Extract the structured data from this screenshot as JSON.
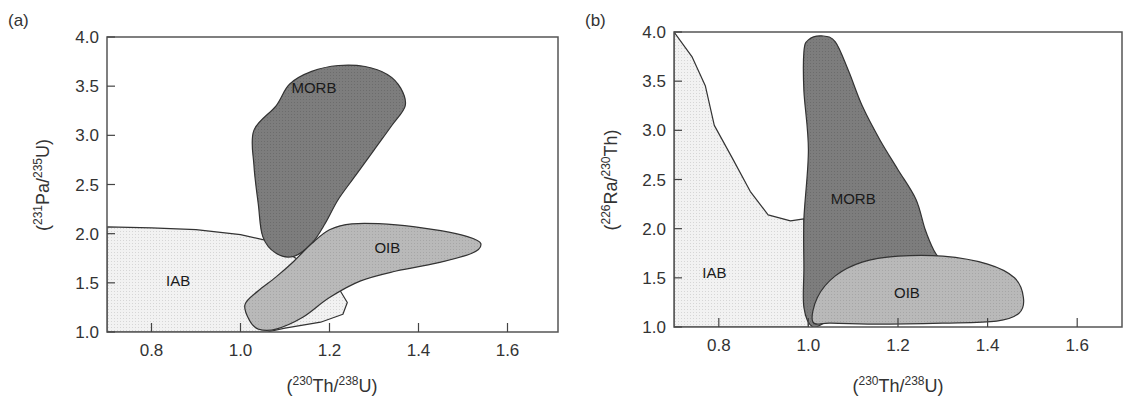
{
  "figure": {
    "panels": [
      {
        "id": "a",
        "label": "(a)",
        "xlabel": {
          "open": "(",
          "sup1": "230",
          "mid": "Th/",
          "sup2": "238",
          "close": "U)"
        },
        "ylabel": {
          "open": "(",
          "sup1": "231",
          "mid": "Pa/",
          "sup2": "235",
          "close": "U)"
        }
      },
      {
        "id": "b",
        "label": "(b)",
        "xlabel": {
          "open": "(",
          "sup1": "230",
          "mid": "Th/",
          "sup2": "238",
          "close": "U)"
        },
        "ylabel": {
          "open": "(",
          "sup1": "226",
          "mid": "Ra/",
          "sup2": "230",
          "close": "Th)"
        }
      }
    ]
  },
  "chart_data": [
    {
      "type": "area",
      "panel": "(a)",
      "title": "",
      "xlabel": "(230Th/238U)",
      "ylabel": "(231Pa/235U)",
      "xlim": [
        0.7,
        1.7
      ],
      "ylim": [
        1.0,
        4.0
      ],
      "xticks": [
        0.8,
        1.0,
        1.2,
        1.4,
        1.6
      ],
      "xtick_labels": [
        "0.8",
        "1.0",
        "1.2",
        "1.4",
        "1.6"
      ],
      "yticks": [
        1.0,
        1.5,
        2.0,
        2.5,
        3.0,
        3.5,
        4.0
      ],
      "ytick_labels": [
        "1.0",
        "1.5",
        "2.0",
        "2.5",
        "3.0",
        "3.5",
        "4.0"
      ],
      "grid": false,
      "legend": "none (regions labeled inline)",
      "regions": [
        {
          "name": "IAB",
          "fill": "#ececec",
          "label_pos": [
            0.86,
            1.52
          ],
          "outline": [
            [
              0.7,
              2.07
            ],
            [
              0.8,
              2.06
            ],
            [
              0.9,
              2.04
            ],
            [
              1.0,
              1.99
            ],
            [
              1.06,
              1.93
            ],
            [
              1.1,
              1.82
            ],
            [
              1.17,
              1.62
            ],
            [
              1.22,
              1.45
            ],
            [
              1.24,
              1.3
            ],
            [
              1.23,
              1.18
            ],
            [
              1.18,
              1.1
            ],
            [
              1.1,
              1.04
            ],
            [
              1.06,
              1.0
            ],
            [
              0.7,
              1.0
            ]
          ]
        },
        {
          "name": "MORB",
          "fill": "#7a7a7a",
          "label_pos": [
            1.165,
            3.48
          ],
          "outline": [
            [
              1.08,
              3.3
            ],
            [
              1.11,
              3.52
            ],
            [
              1.16,
              3.65
            ],
            [
              1.22,
              3.71
            ],
            [
              1.28,
              3.7
            ],
            [
              1.33,
              3.62
            ],
            [
              1.36,
              3.48
            ],
            [
              1.37,
              3.3
            ],
            [
              1.34,
              3.1
            ],
            [
              1.3,
              2.85
            ],
            [
              1.26,
              2.6
            ],
            [
              1.22,
              2.35
            ],
            [
              1.19,
              2.1
            ],
            [
              1.16,
              1.9
            ],
            [
              1.12,
              1.77
            ],
            [
              1.08,
              1.8
            ],
            [
              1.05,
              1.97
            ],
            [
              1.04,
              2.3
            ],
            [
              1.03,
              2.7
            ],
            [
              1.03,
              3.05
            ]
          ]
        },
        {
          "name": "OIB",
          "fill": "#b3b3b3",
          "label_pos": [
            1.33,
            1.85
          ],
          "outline": [
            [
              1.02,
              1.12
            ],
            [
              1.01,
              1.28
            ],
            [
              1.04,
              1.42
            ],
            [
              1.08,
              1.56
            ],
            [
              1.12,
              1.72
            ],
            [
              1.16,
              1.9
            ],
            [
              1.2,
              2.04
            ],
            [
              1.25,
              2.1
            ],
            [
              1.35,
              2.09
            ],
            [
              1.45,
              2.03
            ],
            [
              1.51,
              1.97
            ],
            [
              1.54,
              1.9
            ],
            [
              1.52,
              1.8
            ],
            [
              1.44,
              1.7
            ],
            [
              1.35,
              1.62
            ],
            [
              1.27,
              1.52
            ],
            [
              1.2,
              1.35
            ],
            [
              1.14,
              1.15
            ],
            [
              1.08,
              1.03
            ],
            [
              1.04,
              1.03
            ]
          ]
        }
      ]
    },
    {
      "type": "area",
      "panel": "(b)",
      "title": "",
      "xlabel": "(230Th/238U)",
      "ylabel": "(226Ra/230Th)",
      "xlim": [
        0.7,
        1.7
      ],
      "ylim": [
        1.0,
        4.0
      ],
      "xticks": [
        0.8,
        1.0,
        1.2,
        1.4,
        1.6
      ],
      "xtick_labels": [
        "0.8",
        "1.0",
        "1.2",
        "1.4",
        "1.6"
      ],
      "yticks": [
        1.0,
        1.5,
        2.0,
        2.5,
        3.0,
        3.5,
        4.0
      ],
      "ytick_labels": [
        "1.0",
        "1.5",
        "2.0",
        "2.5",
        "3.0",
        "3.5",
        "4.0"
      ],
      "grid": false,
      "legend": "none (regions labeled inline)",
      "regions": [
        {
          "name": "IAB",
          "fill": "#ececec",
          "label_pos": [
            0.79,
            1.55
          ],
          "outline": [
            [
              0.7,
              4.0
            ],
            [
              0.74,
              3.75
            ],
            [
              0.77,
              3.45
            ],
            [
              0.79,
              3.05
            ],
            [
              0.83,
              2.72
            ],
            [
              0.87,
              2.38
            ],
            [
              0.91,
              2.14
            ],
            [
              0.96,
              2.08
            ],
            [
              0.99,
              2.1
            ],
            [
              1.0,
              1.0
            ],
            [
              0.7,
              1.0
            ]
          ]
        },
        {
          "name": "MORB",
          "fill": "#7a7a7a",
          "label_pos": [
            1.1,
            2.3
          ],
          "outline": [
            [
              0.99,
              3.8
            ],
            [
              1.0,
              3.92
            ],
            [
              1.03,
              3.96
            ],
            [
              1.06,
              3.9
            ],
            [
              1.09,
              3.6
            ],
            [
              1.12,
              3.25
            ],
            [
              1.16,
              2.9
            ],
            [
              1.2,
              2.6
            ],
            [
              1.24,
              2.3
            ],
            [
              1.26,
              2.0
            ],
            [
              1.28,
              1.78
            ],
            [
              1.31,
              1.55
            ],
            [
              1.3,
              1.3
            ],
            [
              1.2,
              1.2
            ],
            [
              1.05,
              1.06
            ],
            [
              1.01,
              1.0
            ],
            [
              0.99,
              1.2
            ],
            [
              0.99,
              1.6
            ],
            [
              0.99,
              2.1
            ],
            [
              1.0,
              2.8
            ],
            [
              0.99,
              3.4
            ]
          ]
        },
        {
          "name": "OIB",
          "fill": "#b3b3b3",
          "label_pos": [
            1.22,
            1.35
          ],
          "outline": [
            [
              1.01,
              1.05
            ],
            [
              1.02,
              1.3
            ],
            [
              1.06,
              1.52
            ],
            [
              1.12,
              1.66
            ],
            [
              1.2,
              1.72
            ],
            [
              1.3,
              1.72
            ],
            [
              1.4,
              1.64
            ],
            [
              1.46,
              1.5
            ],
            [
              1.48,
              1.3
            ],
            [
              1.47,
              1.14
            ],
            [
              1.42,
              1.06
            ],
            [
              1.3,
              1.04
            ],
            [
              1.15,
              1.03
            ],
            [
              1.05,
              1.04
            ]
          ]
        }
      ]
    }
  ]
}
